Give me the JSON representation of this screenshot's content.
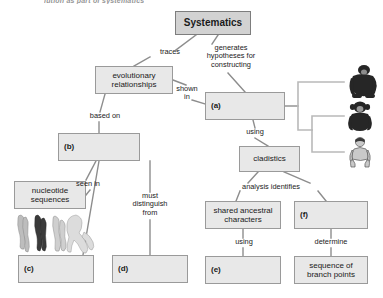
{
  "figure": {
    "cut_off_heading": "lution as part of systematics",
    "title_box": {
      "label": "Systematics"
    }
  },
  "nodes": [
    {
      "id": "systematics",
      "label": "Systematics",
      "x": 175,
      "y": 11,
      "w": 76,
      "h": 24,
      "style": "title"
    },
    {
      "id": "evolutionary-relationships",
      "label": "evolutionary\nrelationships",
      "x": 95,
      "y": 66,
      "w": 78,
      "h": 28,
      "style": "plain"
    },
    {
      "id": "box-a",
      "label": "(a)",
      "x": 205,
      "y": 92,
      "w": 80,
      "h": 28,
      "style": "blank"
    },
    {
      "id": "box-b",
      "label": "(b)",
      "x": 58,
      "y": 133,
      "w": 82,
      "h": 28,
      "style": "blank"
    },
    {
      "id": "cladistics",
      "label": "cladistics",
      "x": 239,
      "y": 146,
      "w": 61,
      "h": 26,
      "style": "plain"
    },
    {
      "id": "nucleotide-sequences",
      "label": "nucleotide\nsequences",
      "x": 14,
      "y": 181,
      "w": 72,
      "h": 28,
      "style": "plain"
    },
    {
      "id": "shared-ancestral-characters",
      "label": "shared ancestral\ncharacters",
      "x": 205,
      "y": 201,
      "w": 76,
      "h": 28,
      "style": "plain"
    },
    {
      "id": "box-f",
      "label": "(f)",
      "x": 294,
      "y": 201,
      "w": 74,
      "h": 28,
      "style": "blank"
    },
    {
      "id": "box-c",
      "label": "(c)",
      "x": 18,
      "y": 255,
      "w": 76,
      "h": 28,
      "style": "blank"
    },
    {
      "id": "box-d",
      "label": "(d)",
      "x": 112,
      "y": 255,
      "w": 76,
      "h": 28,
      "style": "blank"
    },
    {
      "id": "box-e",
      "label": "(e)",
      "x": 205,
      "y": 256,
      "w": 76,
      "h": 28,
      "style": "blank"
    },
    {
      "id": "sequence-of-branch-points",
      "label": "sequence of\nbranch points",
      "x": 294,
      "y": 256,
      "w": 74,
      "h": 28,
      "style": "plain"
    }
  ],
  "edge_labels": [
    {
      "id": "traces",
      "text": "traces",
      "x": 152,
      "y": 48,
      "w": 36
    },
    {
      "id": "generates-hypotheses-for-constructing",
      "text": "generates\nhypotheses for\nconstructing",
      "x": 194,
      "y": 44,
      "w": 74
    },
    {
      "id": "shown-in",
      "text": "shown\nin",
      "x": 172,
      "y": 85,
      "w": 30
    },
    {
      "id": "based-on",
      "text": "based on",
      "x": 82,
      "y": 112,
      "w": 46
    },
    {
      "id": "using-cladistics",
      "text": "using",
      "x": 241,
      "y": 128,
      "w": 28
    },
    {
      "id": "seen-in",
      "text": "seen in",
      "x": 70,
      "y": 180,
      "w": 36
    },
    {
      "id": "must-distinguish-from",
      "text": "must\ndistinguish\nfrom",
      "x": 122,
      "y": 192,
      "w": 56
    },
    {
      "id": "analysis-identifies",
      "text": "analysis identifies",
      "x": 226,
      "y": 183,
      "w": 90
    },
    {
      "id": "using-shared",
      "text": "using",
      "x": 230,
      "y": 238,
      "w": 28
    },
    {
      "id": "determine",
      "text": "determine",
      "x": 305,
      "y": 238,
      "w": 52
    }
  ],
  "cladogram": {
    "taxa": [
      {
        "id": "gorilla",
        "label": "gorilla"
      },
      {
        "id": "chimpanzee",
        "label": "chimpanzee"
      },
      {
        "id": "human",
        "label": "human"
      }
    ]
  },
  "colors": {
    "node_fill": "#e8e8e8",
    "node_border": "#9a9a9a",
    "title_fill": "#d2d2d2",
    "title_border": "#7d7d7d",
    "connector": "#8d8d8d",
    "text": "#1a1a1a"
  }
}
